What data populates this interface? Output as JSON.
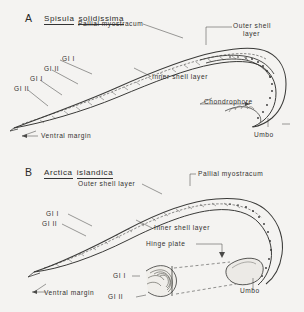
{
  "figure": {
    "background_color": "#f4f3f1",
    "ink_color": "#333230",
    "panels": [
      {
        "letter": "A",
        "species_genus": "Spisula",
        "species_epithet": "solidissima",
        "labels": {
          "pallial_myostracum": "Pallial myostracum",
          "outer_shell_layer_line1": "Outer shell",
          "outer_shell_layer_line2": "layer",
          "inner_shell_layer": "Inner shell layer",
          "growth_increment_1": "GI I",
          "growth_increment_2": "GI II",
          "growth_increment_3": "GI I",
          "growth_increment_4": "GI II",
          "chondrophore": "Chondrophore",
          "umbo": "Umbo",
          "ventral_margin": "Ventral margin"
        }
      },
      {
        "letter": "B",
        "species_genus": "Arctica",
        "species_epithet": "islandica",
        "labels": {
          "pallial_myostracum": "Pallial myostracum",
          "outer_shell_layer": "Outer shell layer",
          "inner_shell_layer": "Inner shell layer",
          "growth_increment_1": "GI I",
          "growth_increment_2": "GI II",
          "hinge_plate": "Hinge plate",
          "umbo": "Umbo",
          "ventral_margin": "Ventral margin",
          "inset_growth_increment_1": "GI I",
          "inset_growth_increment_2": "GI II"
        }
      }
    ]
  }
}
